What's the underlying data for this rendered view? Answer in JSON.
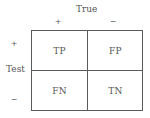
{
  "diagram": {
    "column_header": "True",
    "column_signs": [
      "+",
      "−"
    ],
    "row_header": "Test",
    "row_signs": [
      "+",
      "−"
    ],
    "cells": [
      [
        "TP",
        "FP"
      ],
      [
        "FN",
        "TN"
      ]
    ]
  }
}
